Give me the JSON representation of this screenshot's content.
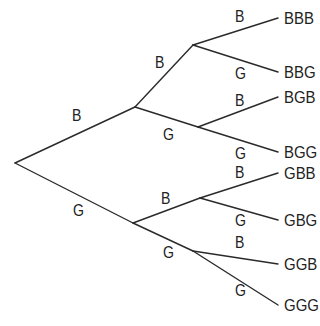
{
  "diagram": {
    "type": "probability-tree",
    "line_color": "#2a2a2a",
    "text_color": "#222222",
    "root": {
      "x": 15,
      "y": 163
    },
    "level1": [
      {
        "label": "B",
        "node": {
          "x": 135,
          "y": 107
        },
        "label_pos": {
          "x": 72,
          "y": 108
        }
      },
      {
        "label": "G",
        "node": {
          "x": 133,
          "y": 223
        },
        "label_pos": {
          "x": 73,
          "y": 203
        }
      }
    ],
    "level2": [
      {
        "label": "B",
        "parent": 0,
        "node": {
          "x": 193,
          "y": 45
        },
        "label_pos": {
          "x": 155,
          "y": 55
        }
      },
      {
        "label": "G",
        "parent": 0,
        "node": {
          "x": 198,
          "y": 127
        },
        "label_pos": {
          "x": 163,
          "y": 127
        }
      },
      {
        "label": "B",
        "parent": 1,
        "node": {
          "x": 200,
          "y": 198
        },
        "label_pos": {
          "x": 161,
          "y": 191
        }
      },
      {
        "label": "G",
        "parent": 1,
        "node": {
          "x": 193,
          "y": 251
        },
        "label_pos": {
          "x": 163,
          "y": 245
        }
      }
    ],
    "level3": [
      {
        "label": "B",
        "parent": 0,
        "outcome": "BBB",
        "end": {
          "x": 278,
          "y": 18
        },
        "label_pos": {
          "x": 235,
          "y": 9
        },
        "outcome_pos": {
          "x": 284,
          "y": 10
        }
      },
      {
        "label": "G",
        "parent": 0,
        "outcome": "BBG",
        "end": {
          "x": 278,
          "y": 72
        },
        "label_pos": {
          "x": 235,
          "y": 66
        },
        "outcome_pos": {
          "x": 284,
          "y": 64
        }
      },
      {
        "label": "B",
        "parent": 1,
        "outcome": "BGB",
        "end": {
          "x": 278,
          "y": 97
        },
        "label_pos": {
          "x": 235,
          "y": 93
        },
        "outcome_pos": {
          "x": 284,
          "y": 89
        }
      },
      {
        "label": "G",
        "parent": 1,
        "outcome": "BGG",
        "end": {
          "x": 278,
          "y": 152
        },
        "label_pos": {
          "x": 235,
          "y": 146
        },
        "outcome_pos": {
          "x": 284,
          "y": 144
        }
      },
      {
        "label": "B",
        "parent": 2,
        "outcome": "GBB",
        "end": {
          "x": 278,
          "y": 173
        },
        "label_pos": {
          "x": 235,
          "y": 165
        },
        "outcome_pos": {
          "x": 284,
          "y": 165
        }
      },
      {
        "label": "G",
        "parent": 2,
        "outcome": "GBG",
        "end": {
          "x": 278,
          "y": 220
        },
        "label_pos": {
          "x": 235,
          "y": 213
        },
        "outcome_pos": {
          "x": 284,
          "y": 212
        }
      },
      {
        "label": "B",
        "parent": 3,
        "outcome": "GGB",
        "end": {
          "x": 278,
          "y": 264
        },
        "label_pos": {
          "x": 235,
          "y": 235
        },
        "outcome_pos": {
          "x": 284,
          "y": 256
        }
      },
      {
        "label": "G",
        "parent": 3,
        "outcome": "GGG",
        "end": {
          "x": 278,
          "y": 305
        },
        "label_pos": {
          "x": 235,
          "y": 283
        },
        "outcome_pos": {
          "x": 284,
          "y": 297
        }
      }
    ]
  }
}
